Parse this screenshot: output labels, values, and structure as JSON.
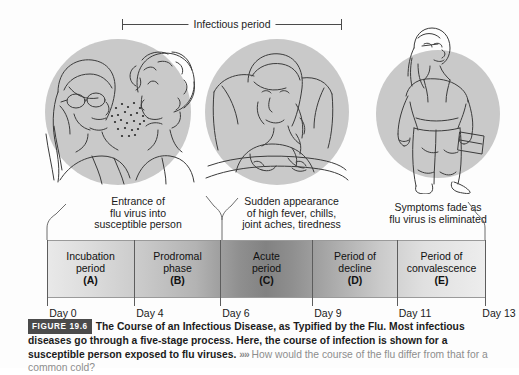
{
  "figure": {
    "infectious_period_label": "Infectious period",
    "stage_captions": [
      "Entrance of\nflu virus into\nsusceptible person",
      "Sudden appearance\nof high fever, chills,\njoint aches, tiredness",
      "Symptoms fade as\nflu virus is eliminated"
    ],
    "timeline": {
      "stages": [
        {
          "name": "Incubation\nperiod",
          "letter": "(A)"
        },
        {
          "name": "Prodromal\nphase",
          "letter": "(B)"
        },
        {
          "name": "Acute\nperiod",
          "letter": "(C)"
        },
        {
          "name": "Period of\ndecline",
          "letter": "(D)"
        },
        {
          "name": "Period of\nconvalescence",
          "letter": "(E)"
        }
      ],
      "day_labels": [
        "Day 0",
        "Day 4",
        "Day 6",
        "Day 9",
        "Day 11",
        "Day 13"
      ]
    },
    "caption": {
      "figure_number": "FIGURE 19.6",
      "title": "The Course of an Infectious Disease, as Typified by the Flu.",
      "body": "Most infectious diseases go through a five-stage process. Here, the course of infection is shown for a susceptible person exposed to flu viruses.",
      "arrows": "»»",
      "question": "How would the course of the flu differ from that for a common cold?"
    },
    "colors": {
      "bar_peak": "#828282",
      "bar_edge": "#ededed",
      "badge": "#4b4b4b",
      "question_text": "#8d8d8d"
    }
  }
}
